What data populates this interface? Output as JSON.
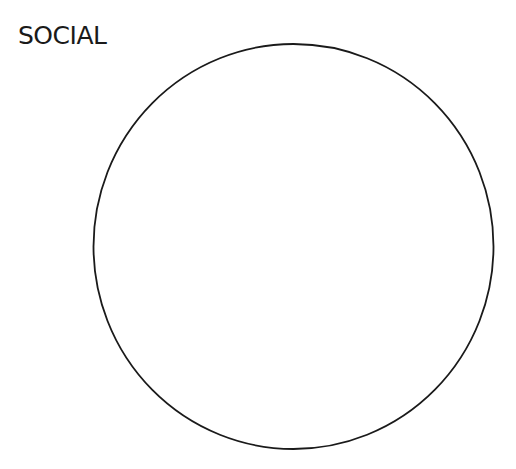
{
  "diagram": {
    "title": "SOCIAL",
    "shape": {
      "type": "circle",
      "cx": 293.5,
      "cy": 246.5,
      "rx": 200,
      "ry": 202.5,
      "stroke": "#1a1a1a",
      "fill": "#ffffff",
      "stroke_width": 1.8
    }
  }
}
